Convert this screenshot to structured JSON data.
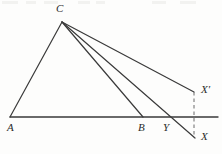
{
  "figure": {
    "background_color": "#fdfdfc",
    "stroke_color": "#3a3a3a",
    "label_color": "#2b2b2b",
    "width": 222,
    "height": 154
  },
  "labels": {
    "A": "A",
    "B": "B",
    "C": "C",
    "Y": "Y",
    "X": "X",
    "X_prime": "X′"
  },
  "points": {
    "A": {
      "x": 10,
      "y": 117,
      "label": "A",
      "label_x": 7,
      "label_y": 122
    },
    "B": {
      "x": 143,
      "y": 117,
      "label": "B",
      "label_x": 138,
      "label_y": 122
    },
    "C": {
      "x": 62,
      "y": 22,
      "label": "C",
      "label_x": 56,
      "label_y": 3
    },
    "Y": {
      "x": 167,
      "y": 117,
      "label": "Y",
      "label_x": 163,
      "label_y": 122
    },
    "X": {
      "x": 195,
      "y": 138,
      "label": "X",
      "label_x": 201,
      "label_y": 131
    },
    "X_prime": {
      "x": 194,
      "y": 92,
      "label": "X′",
      "label_x": 200,
      "label_y": 84
    },
    "baseline_left": {
      "x": 10,
      "y": 117
    },
    "baseline_right": {
      "x": 218,
      "y": 117
    }
  },
  "segments": [
    {
      "name": "baseline-A-to-right",
      "from": "baseline_left",
      "to": "baseline_right",
      "style": "solid",
      "width": 1.4
    },
    {
      "name": "segment-C-to-A",
      "from": "C",
      "to": "A",
      "style": "solid",
      "width": 1.2
    },
    {
      "name": "segment-C-to-B",
      "from": "C",
      "to": "B",
      "style": "solid",
      "width": 1.2
    },
    {
      "name": "segment-C-to-X",
      "from": "C",
      "to": "X",
      "style": "solid",
      "width": 1.2
    },
    {
      "name": "segment-C-to-X-prime",
      "from": "C",
      "to": "X_prime",
      "style": "solid",
      "width": 1.2
    },
    {
      "name": "segment-X-prime-to-X-dashed",
      "from": "X_prime",
      "to": "X",
      "style": "dashed",
      "width": 1.0
    }
  ],
  "noise_marks": [
    {
      "x": 2,
      "y": 1,
      "w": 16,
      "h": 3
    },
    {
      "x": 26,
      "y": 1,
      "w": 10,
      "h": 3
    },
    {
      "x": 44,
      "y": 1,
      "w": 14,
      "h": 3
    },
    {
      "x": 78,
      "y": 1,
      "w": 12,
      "h": 3
    },
    {
      "x": 96,
      "y": 1,
      "w": 9,
      "h": 3
    },
    {
      "x": 152,
      "y": 1,
      "w": 14,
      "h": 3
    },
    {
      "x": 180,
      "y": 1,
      "w": 16,
      "h": 3
    }
  ]
}
